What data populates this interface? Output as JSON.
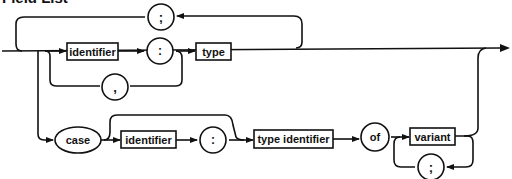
{
  "title": "Field List",
  "diagram": {
    "type": "syntax-diagram",
    "nodes": {
      "separator_semicolon_top": ";",
      "identifier": "identifier",
      "colon": ":",
      "comma": ",",
      "type": "type",
      "case": "case",
      "case_identifier": "identifier",
      "case_colon": ":",
      "type_identifier": "type identifier",
      "of": "of",
      "variant": "variant",
      "separator_semicolon_bottom": ";"
    }
  }
}
